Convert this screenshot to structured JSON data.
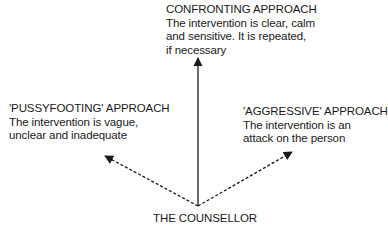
{
  "diagram": {
    "approaches": {
      "confronting": {
        "title": "CONFRONTING APPROACH",
        "line1": "The intervention is clear, calm",
        "line2": "and sensitive. It is repeated,",
        "line3": "if necessary"
      },
      "pussyfooting": {
        "title": "'PUSSYFOOTING' APPROACH",
        "line1": "The intervention is vague,",
        "line2": "unclear and inadequate"
      },
      "aggressive": {
        "title": "'AGGRESSIVE' APPROACH",
        "line1": "The intervention is an",
        "line2": "attack on the person"
      }
    },
    "origin": {
      "label": "THE COUNSELLOR"
    },
    "arrows": [
      {
        "to": "confronting",
        "style": "solid"
      },
      {
        "to": "pussyfooting",
        "style": "dashed"
      },
      {
        "to": "aggressive",
        "style": "dashed"
      }
    ],
    "colors": {
      "ink": "#1a1a1a",
      "background": "#ffffff"
    }
  }
}
